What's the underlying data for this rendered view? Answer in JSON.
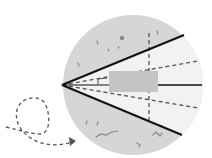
{
  "diagram": {
    "title": "",
    "colors": {
      "background": "#ffffff",
      "field": "#d6d6d6",
      "cone": "#f2f2f2",
      "target_box": "#c4c4c4",
      "solid_line": "#111111",
      "dashed_line": "#555555",
      "speck": "#8a8a8a"
    },
    "circle": {
      "cx": 133,
      "cy": 85,
      "r": 70
    },
    "apex": {
      "x": 62,
      "y": 85
    },
    "cone_edges": [
      {
        "x2": 184,
        "y2": 35
      },
      {
        "x2": 182,
        "y2": 135
      }
    ],
    "center_line": {
      "x1": 158,
      "x2": 202,
      "y": 85
    },
    "inner_dashed_rays": [
      {
        "x2": 198,
        "y2": 61
      },
      {
        "x2": 198,
        "y2": 108
      }
    ],
    "vertical_dashed": {
      "x": 149,
      "y1": 33,
      "y2": 122
    },
    "target_box": {
      "x": 109,
      "y": 71,
      "w": 49,
      "h": 21
    },
    "path_arrow": "dashed looping trajectory entering from left toward the circle"
  }
}
